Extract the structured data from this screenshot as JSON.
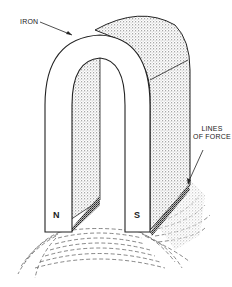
{
  "diagram": {
    "type": "illustration",
    "labels": {
      "iron": "IRON",
      "lines_of_force_line1": "LINES",
      "lines_of_force_line2": "OF FORCE"
    },
    "poles": {
      "north": "N",
      "south": "S"
    },
    "colors": {
      "line": "#222222",
      "shading": "#9a9a9a",
      "background": "#ffffff"
    }
  }
}
